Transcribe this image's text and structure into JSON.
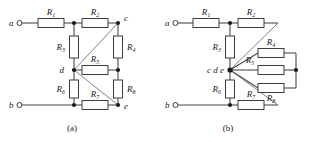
{
  "figure": {
    "type": "circuit-diagram",
    "width": 312,
    "height": 142,
    "background_color": "#ffffff",
    "wire_color": "#4a4a4a",
    "diagonal_color": "#6b6b6b",
    "node_color": "#1a1a1a",
    "resistor_fill": "#ffffff",
    "resistor_stroke": "#3c3c3c"
  },
  "panels": [
    {
      "id": "a",
      "caption": "(a)",
      "terminals": [
        {
          "name": "a",
          "label": "a",
          "x": 18,
          "y": 23
        },
        {
          "name": "b",
          "label": "b",
          "x": 18,
          "y": 105
        }
      ],
      "nodes": [
        {
          "name": "c",
          "label": "c",
          "x": 118,
          "y": 23
        },
        {
          "name": "d",
          "label": "d",
          "x": 74,
          "y": 70
        },
        {
          "name": "e",
          "label": "e",
          "x": 118,
          "y": 105
        }
      ],
      "resistors": [
        {
          "name": "R1",
          "label": "R",
          "sub": "1",
          "orientation": "horizontal"
        },
        {
          "name": "R2",
          "label": "R",
          "sub": "2",
          "orientation": "horizontal"
        },
        {
          "name": "R3",
          "label": "R",
          "sub": "3",
          "orientation": "vertical"
        },
        {
          "name": "R4",
          "label": "R",
          "sub": "4",
          "orientation": "vertical"
        },
        {
          "name": "R5",
          "label": "R",
          "sub": "5",
          "orientation": "horizontal"
        },
        {
          "name": "R6",
          "label": "R",
          "sub": "6",
          "orientation": "vertical"
        },
        {
          "name": "R7",
          "label": "R",
          "sub": "7",
          "orientation": "horizontal"
        },
        {
          "name": "R8",
          "label": "R",
          "sub": "8",
          "orientation": "vertical"
        }
      ]
    },
    {
      "id": "b",
      "caption": "(b)",
      "terminals": [
        {
          "name": "a",
          "label": "a",
          "x": 174,
          "y": 23
        },
        {
          "name": "b",
          "label": "b",
          "x": 174,
          "y": 105
        }
      ],
      "nodes": [
        {
          "name": "cde",
          "label": "c d e",
          "x": 230,
          "y": 70
        }
      ],
      "resistors": [
        {
          "name": "R1",
          "label": "R",
          "sub": "1",
          "orientation": "horizontal"
        },
        {
          "name": "R2",
          "label": "R",
          "sub": "2",
          "orientation": "horizontal"
        },
        {
          "name": "R3",
          "label": "R",
          "sub": "3",
          "orientation": "vertical"
        },
        {
          "name": "R4",
          "label": "R",
          "sub": "4",
          "orientation": "horizontal"
        },
        {
          "name": "R5",
          "label": "R",
          "sub": "5",
          "orientation": "horizontal"
        },
        {
          "name": "R6",
          "label": "R",
          "sub": "6",
          "orientation": "vertical"
        },
        {
          "name": "R7",
          "label": "R",
          "sub": "7",
          "orientation": "horizontal"
        },
        {
          "name": "R8",
          "label": "R",
          "sub": "8",
          "orientation": "horizontal"
        }
      ]
    }
  ],
  "labels": {
    "a_terminal": "a",
    "b_terminal": "b",
    "node_c": "c",
    "node_d": "d",
    "node_e": "e",
    "node_cde": "c d e",
    "caption_a": "(a)",
    "caption_b": "(b)",
    "R": "R",
    "s1": "1",
    "s2": "2",
    "s3": "3",
    "s4": "4",
    "s5": "5",
    "s6": "6",
    "s7": "7",
    "s8": "8"
  }
}
